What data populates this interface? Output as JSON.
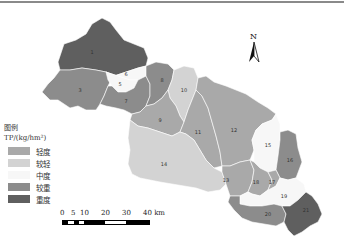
{
  "legend": {
    "title": "图例",
    "unit": "TP/(kg/hm²)",
    "items": [
      {
        "label": "轻度",
        "color": "#a9a9a9"
      },
      {
        "label": "较轻",
        "color": "#d3d3d3"
      },
      {
        "label": "中度",
        "color": "#f7f7f7"
      },
      {
        "label": "较重",
        "color": "#8c8c8c"
      },
      {
        "label": "重度",
        "color": "#5f5f5f"
      }
    ]
  },
  "north_arrow": {
    "label": "N"
  },
  "scale_bar": {
    "ticks": [
      "0",
      "5",
      "10",
      "20",
      "30",
      "40 km"
    ]
  },
  "subbasins": [
    {
      "id": "1",
      "class": "重度"
    },
    {
      "id": "6",
      "class": "中度"
    },
    {
      "id": "5",
      "class": "中度"
    },
    {
      "id": "3",
      "class": "较重"
    },
    {
      "id": "7",
      "class": "较重"
    },
    {
      "id": "8",
      "class": "较重"
    },
    {
      "id": "10",
      "class": "较轻"
    },
    {
      "id": "9",
      "class": "轻度"
    },
    {
      "id": "11",
      "class": "轻度"
    },
    {
      "id": "12",
      "class": "轻度"
    },
    {
      "id": "14",
      "class": "较轻"
    },
    {
      "id": "13",
      "class": "轻度"
    },
    {
      "id": "15",
      "class": "中度"
    },
    {
      "id": "16",
      "class": "较重"
    },
    {
      "id": "18",
      "class": "轻度"
    },
    {
      "id": "17",
      "class": "轻度"
    },
    {
      "id": "19",
      "class": "中度"
    },
    {
      "id": "20",
      "class": "较重"
    },
    {
      "id": "21",
      "class": "重度"
    }
  ]
}
